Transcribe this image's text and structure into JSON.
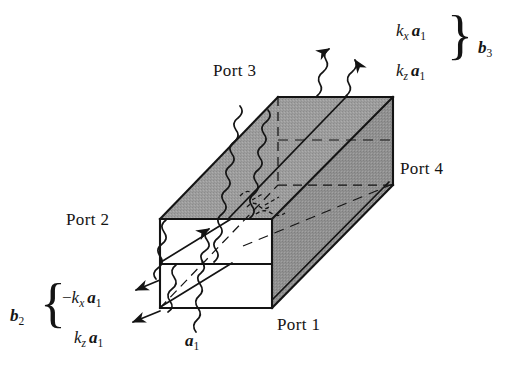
{
  "figure": {
    "type": "technical-line-diagram",
    "colors": {
      "line": "#141414",
      "shaded_face": "#9b9b9b",
      "shaded_face_dark": "#8e8e8e",
      "unshaded_face": "#ffffff",
      "background": "#ffffff"
    }
  },
  "ports": [
    {
      "id": "port1",
      "label": "Port 1",
      "x": 277,
      "y": 316
    },
    {
      "id": "port2",
      "label": "Port 2",
      "x": 66,
      "y": 211
    },
    {
      "id": "port3",
      "label": "Port 3",
      "x": 213,
      "y": 62
    },
    {
      "id": "port4",
      "label": "Port 4",
      "x": 400,
      "y": 160
    }
  ],
  "annotations": {
    "incident": {
      "id": "a1",
      "symbol": "a",
      "subscript": "1",
      "x": 185,
      "y": 335
    },
    "output_b3": {
      "group_label": {
        "symbol": "b",
        "subscript": "3"
      },
      "group_x": 478,
      "group_y": 39,
      "brace": "}",
      "brace_x": 447,
      "brace_y": 10,
      "terms": [
        {
          "prefix": "",
          "coef": "k",
          "coef_sub": "x",
          "symbol": "a",
          "symbol_sub": "1",
          "x": 396,
          "y": 22
        },
        {
          "prefix": "",
          "coef": "k",
          "coef_sub": "z",
          "symbol": "a",
          "symbol_sub": "1",
          "x": 396,
          "y": 62
        }
      ]
    },
    "output_b2": {
      "group_label": {
        "symbol": "b",
        "subscript": "2"
      },
      "group_x": 10,
      "group_y": 307,
      "brace": "{",
      "brace_x": 40,
      "brace_y": 278,
      "terms": [
        {
          "prefix": "−",
          "coef": "k",
          "coef_sub": "x",
          "symbol": "a",
          "symbol_sub": "1",
          "x": 62,
          "y": 289
        },
        {
          "prefix": "",
          "coef": "k",
          "coef_sub": "z",
          "symbol": "a",
          "symbol_sub": "1",
          "x": 74,
          "y": 329
        }
      ]
    }
  },
  "geometry": {
    "front_face": {
      "left": 160,
      "right": 272,
      "top": 219,
      "bottom": 308,
      "divider_y": 264
    },
    "far_face": {
      "left": 278,
      "right": 393,
      "top": 97,
      "bottom": 185
    },
    "depth_vector": {
      "dx": 118,
      "dy": -122
    },
    "waves": 4,
    "dashed_interior_lines": 3
  }
}
